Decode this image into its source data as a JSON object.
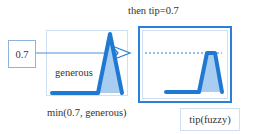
{
  "diagram": {
    "title": "then tip=0.7",
    "input_value": "0.7",
    "membership_label": "generous",
    "operation_label": "min(0.7, generous)",
    "output_label": "tip(fuzzy)",
    "icons": {
      "arrow": "hollow-arrowhead",
      "input_shape": "triangle-membership",
      "output_shape": "clipped-trapezoid"
    },
    "colors": {
      "accent": "#1f78d1",
      "fill": "#a9cdf0",
      "border_light": "#cfe0f2",
      "text": "#333333"
    },
    "cut_level": 0.7
  }
}
